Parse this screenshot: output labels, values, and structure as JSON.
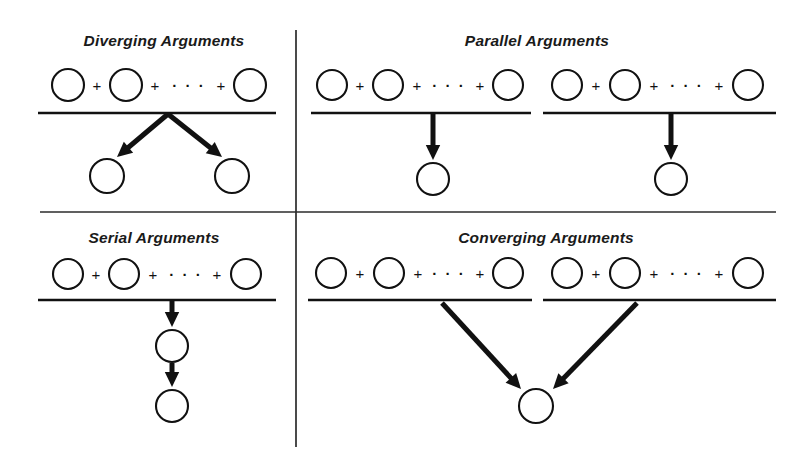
{
  "figure": {
    "background_color": "#ffffff",
    "ink_color": "#111111",
    "width": 808,
    "height": 460,
    "dividers": {
      "vertical": {
        "x": 296,
        "y1": 30,
        "y2": 447,
        "color": "#2b2b2b"
      },
      "horizontal": {
        "y": 212,
        "x1": 40,
        "x2": 776,
        "color": "#2b2b2b"
      }
    },
    "symbols": {
      "plus": "+",
      "ellipsis": "· · ·",
      "premise_node": "circle",
      "conclusion_node": "circle",
      "inference_mark": "arrow"
    }
  },
  "quadrants": [
    {
      "id": "diverging",
      "title": "Diverging Arguments",
      "title_x": 164,
      "title_y": 46,
      "structure": "one premise group supporting two separate conclusions",
      "premise_groups": [
        {
          "line": {
            "x1": 38,
            "x2": 276,
            "y": 113
          },
          "circles": [
            {
              "cx": 68,
              "cy": 85,
              "r": 16
            },
            {
              "cx": 126,
              "cy": 85,
              "r": 16
            },
            {
              "cx": 250,
              "cy": 85,
              "r": 16
            }
          ],
          "plus_positions": [
            {
              "x": 97,
              "y": 91
            },
            {
              "x": 155,
              "y": 91
            },
            {
              "x": 221,
              "y": 91
            }
          ],
          "ellipsis_position": {
            "x": 189,
            "y": 91
          }
        }
      ],
      "conclusions": [
        {
          "cx": 107,
          "cy": 176,
          "r": 17
        },
        {
          "cx": 232,
          "cy": 176,
          "r": 17
        }
      ],
      "arrows": [
        {
          "x1": 168,
          "y1": 114,
          "x2": 117,
          "y2": 157
        },
        {
          "x1": 168,
          "y1": 114,
          "x2": 222,
          "y2": 157
        }
      ]
    },
    {
      "id": "parallel",
      "title": "Parallel Arguments",
      "title_x": 537,
      "title_y": 46,
      "structure": "two independent premise groups each supporting its own conclusion",
      "premise_groups": [
        {
          "line": {
            "x1": 311,
            "x2": 531,
            "y": 113
          },
          "circles": [
            {
              "cx": 332,
              "cy": 85,
              "r": 15
            },
            {
              "cx": 388,
              "cy": 85,
              "r": 15
            },
            {
              "cx": 508,
              "cy": 85,
              "r": 15
            }
          ],
          "plus_positions": [
            {
              "x": 360,
              "y": 91
            },
            {
              "x": 417,
              "y": 91
            },
            {
              "x": 480,
              "y": 91
            }
          ],
          "ellipsis_position": {
            "x": 449,
            "y": 91
          }
        },
        {
          "line": {
            "x1": 543,
            "x2": 776,
            "y": 113
          },
          "circles": [
            {
              "cx": 567,
              "cy": 85,
              "r": 15
            },
            {
              "cx": 625,
              "cy": 85,
              "r": 15
            },
            {
              "cx": 748,
              "cy": 85,
              "r": 15
            }
          ],
          "plus_positions": [
            {
              "x": 596,
              "y": 91
            },
            {
              "x": 654,
              "y": 91
            },
            {
              "x": 719,
              "y": 91
            }
          ],
          "ellipsis_position": {
            "x": 687,
            "y": 91
          }
        }
      ],
      "conclusions": [
        {
          "cx": 433,
          "cy": 179,
          "r": 16
        },
        {
          "cx": 671,
          "cy": 179,
          "r": 16
        }
      ],
      "arrows": [
        {
          "x1": 433,
          "y1": 114,
          "x2": 433,
          "y2": 160
        },
        {
          "x1": 671,
          "y1": 114,
          "x2": 671,
          "y2": 160
        }
      ]
    },
    {
      "id": "serial",
      "title": "Serial Arguments",
      "title_x": 154,
      "title_y": 243,
      "structure": "one premise group supporting a conclusion which supports a further conclusion",
      "premise_groups": [
        {
          "line": {
            "x1": 38,
            "x2": 276,
            "y": 300
          },
          "circles": [
            {
              "cx": 68,
              "cy": 274,
              "r": 15
            },
            {
              "cx": 124,
              "cy": 274,
              "r": 15
            },
            {
              "cx": 246,
              "cy": 274,
              "r": 15
            }
          ],
          "plus_positions": [
            {
              "x": 96,
              "y": 280
            },
            {
              "x": 153,
              "y": 280
            },
            {
              "x": 217,
              "y": 280
            }
          ],
          "ellipsis_position": {
            "x": 186,
            "y": 280
          }
        }
      ],
      "conclusions": [
        {
          "cx": 172,
          "cy": 346,
          "r": 16
        },
        {
          "cx": 172,
          "cy": 406,
          "r": 16
        }
      ],
      "arrows": [
        {
          "x1": 172,
          "y1": 301,
          "x2": 172,
          "y2": 327
        },
        {
          "x1": 172,
          "y1": 363,
          "x2": 172,
          "y2": 387
        }
      ]
    },
    {
      "id": "converging",
      "title": "Converging Arguments",
      "title_x": 546,
      "title_y": 243,
      "structure": "two independent premise groups converging on a single shared conclusion",
      "premise_groups": [
        {
          "line": {
            "x1": 308,
            "x2": 532,
            "y": 300
          },
          "circles": [
            {
              "cx": 331,
              "cy": 273,
              "r": 15
            },
            {
              "cx": 389,
              "cy": 273,
              "r": 15
            },
            {
              "cx": 508,
              "cy": 273,
              "r": 15
            }
          ],
          "plus_positions": [
            {
              "x": 360,
              "y": 279
            },
            {
              "x": 418,
              "y": 279
            },
            {
              "x": 480,
              "y": 279
            }
          ],
          "ellipsis_position": {
            "x": 449,
            "y": 279
          }
        },
        {
          "line": {
            "x1": 543,
            "x2": 776,
            "y": 300
          },
          "circles": [
            {
              "cx": 567,
              "cy": 273,
              "r": 15
            },
            {
              "cx": 625,
              "cy": 273,
              "r": 15
            },
            {
              "cx": 748,
              "cy": 273,
              "r": 15
            }
          ],
          "plus_positions": [
            {
              "x": 596,
              "y": 279
            },
            {
              "x": 654,
              "y": 279
            },
            {
              "x": 719,
              "y": 279
            }
          ],
          "ellipsis_position": {
            "x": 687,
            "y": 279
          }
        }
      ],
      "conclusions": [
        {
          "cx": 536,
          "cy": 406,
          "r": 17
        }
      ],
      "arrows": [
        {
          "x1": 442,
          "y1": 303,
          "x2": 521,
          "y2": 389
        },
        {
          "x1": 637,
          "y1": 303,
          "x2": 553,
          "y2": 389
        }
      ]
    }
  ]
}
